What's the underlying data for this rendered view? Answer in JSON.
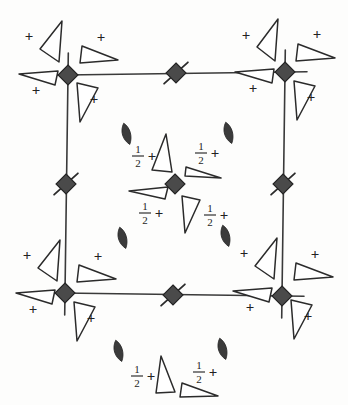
{
  "diagram": {
    "kind": "space-group-symmetry-diagram",
    "title": "",
    "background_color": "#fdfdfc",
    "ink_color": "#2b2b2b",
    "symbol_fill_color": "#4a4a4a",
    "cell": {
      "name": "unit-cell-outline",
      "corners": [
        {
          "x": 68,
          "y": 75
        },
        {
          "x": 285,
          "y": 72
        },
        {
          "x": 282,
          "y": 296
        },
        {
          "x": 65,
          "y": 293
        }
      ]
    },
    "symmetry_elements": {
      "inversion_tetrad": {
        "glyph": "filled-diamond",
        "label": "4-bar",
        "positions": [
          {
            "name": "corner-top-left",
            "x": 68,
            "y": 75
          },
          {
            "name": "corner-top-right",
            "x": 285,
            "y": 72
          },
          {
            "name": "corner-bottom-right",
            "x": 282,
            "y": 296
          },
          {
            "name": "corner-bottom-left",
            "x": 65,
            "y": 293
          },
          {
            "name": "cell-center",
            "x": 175,
            "y": 184
          }
        ],
        "size": 10
      },
      "tetrad_with_tails": {
        "glyph": "filled-diamond-with-diagonal-tails",
        "label": "4-bar with 2-fold tails",
        "positions": [
          {
            "name": "edge-mid-top",
            "x": 176,
            "y": 73,
            "tail_angle": -42
          },
          {
            "name": "edge-mid-bottom",
            "x": 173,
            "y": 295,
            "tail_angle": -42
          },
          {
            "name": "edge-mid-left",
            "x": 66,
            "y": 184,
            "tail_angle": -42
          },
          {
            "name": "edge-mid-right",
            "x": 283,
            "y": 184,
            "tail_angle": -42
          }
        ],
        "size": 10,
        "tail_length": 16
      },
      "diad_lens": {
        "glyph": "pointed-lens",
        "label": "2-fold axis",
        "positions": [
          {
            "name": "lens-inner-top-left",
            "x": 126,
            "y": 134
          },
          {
            "name": "lens-inner-top-right",
            "x": 228,
            "y": 133
          },
          {
            "name": "lens-inner-bottom-left",
            "x": 122,
            "y": 238
          },
          {
            "name": "lens-inner-bottom-right",
            "x": 225,
            "y": 236
          },
          {
            "name": "lens-outer-bottom-left",
            "x": 118,
            "y": 351
          },
          {
            "name": "lens-outer-bottom-right",
            "x": 222,
            "y": 349
          }
        ]
      }
    },
    "motifs": {
      "plus_label": "+",
      "half_plus_label": "½+",
      "fraction_numerator": "1",
      "fraction_denominator": "2",
      "groups": [
        {
          "name": "motif-group-corner-top-left",
          "height_label": "+",
          "triangles": [
            {
              "name": "triangle-tl-a",
              "points": "40,49 62,21 59,62",
              "plus": {
                "x": 29,
                "y": 38
              }
            },
            {
              "name": "triangle-tl-b",
              "points": "82,46 118,60 80,63",
              "plus": {
                "x": 101,
                "y": 39
              }
            },
            {
              "name": "triangle-tl-c",
              "points": "55,85 19,74 58,71",
              "plus": {
                "x": 36,
                "y": 92
              }
            },
            {
              "name": "triangle-tl-d",
              "points": "77,83 80,122 98,88",
              "plus": {
                "x": 94,
                "y": 101
              }
            }
          ]
        },
        {
          "name": "motif-group-corner-top-right",
          "height_label": "+",
          "triangles": [
            {
              "name": "triangle-tr-a",
              "points": "257,47 278,19 275,61",
              "plus": {
                "x": 246,
                "y": 37
              }
            },
            {
              "name": "triangle-tr-b",
              "points": "298,44 335,58 296,61",
              "plus": {
                "x": 317,
                "y": 36
              }
            },
            {
              "name": "triangle-tr-c",
              "points": "272,83 235,72 274,69",
              "plus": {
                "x": 253,
                "y": 90
              }
            },
            {
              "name": "triangle-tr-d",
              "points": "294,81 297,120 315,86",
              "plus": {
                "x": 311,
                "y": 99
              }
            }
          ]
        },
        {
          "name": "motif-group-corner-bottom-left",
          "height_label": "+",
          "triangles": [
            {
              "name": "triangle-bl-a",
              "points": "38,268 60,240 57,281",
              "plus": {
                "x": 27,
                "y": 257
              }
            },
            {
              "name": "triangle-bl-b",
              "points": "79,265 116,279 77,282",
              "plus": {
                "x": 98,
                "y": 258
              }
            },
            {
              "name": "triangle-bl-c",
              "points": "52,304 16,293 55,290",
              "plus": {
                "x": 33,
                "y": 311
              }
            },
            {
              "name": "triangle-bl-d",
              "points": "74,302 77,341 95,307",
              "plus": {
                "x": 91,
                "y": 320
              }
            }
          ]
        },
        {
          "name": "motif-group-corner-bottom-right",
          "height_label": "+",
          "triangles": [
            {
              "name": "triangle-br-a",
              "points": "255,266 277,238 274,279",
              "plus": {
                "x": 244,
                "y": 255
              }
            },
            {
              "name": "triangle-br-b",
              "points": "296,263 333,277 294,280",
              "plus": {
                "x": 315,
                "y": 256
              }
            },
            {
              "name": "triangle-br-c",
              "points": "269,302 233,291 272,288",
              "plus": {
                "x": 250,
                "y": 309
              }
            },
            {
              "name": "triangle-br-d",
              "points": "291,300 294,339 312,305",
              "plus": {
                "x": 308,
                "y": 318
              }
            }
          ]
        },
        {
          "name": "motif-group-cell-center",
          "height_label": "½+",
          "triangles": [
            {
              "name": "triangle-c-a",
              "points": "152,170 166,134 172,172",
              "half": {
                "x": 138,
                "y": 156
              }
            },
            {
              "name": "triangle-c-b",
              "points": "186,167 221,178 185,176",
              "half": {
                "x": 201,
                "y": 153
              }
            },
            {
              "name": "triangle-c-c",
              "points": "165,199 129,191 168,187",
              "half": {
                "x": 145,
                "y": 213
              }
            },
            {
              "name": "triangle-c-d",
              "points": "182,196 185,233 200,200",
              "half": {
                "x": 210,
                "y": 215
              }
            }
          ]
        },
        {
          "name": "motif-group-below-cell",
          "height_label": "½+",
          "triangles": [
            {
              "name": "triangle-bb-a",
              "points": "156,393 161,356 175,392",
              "half": {
                "x": 137,
                "y": 376
              }
            },
            {
              "name": "triangle-bb-b",
              "points": "182,383 218,396 180,397",
              "half": {
                "x": 199,
                "y": 372
              }
            }
          ]
        }
      ]
    }
  },
  "chart_data": {
    "type": "diagram",
    "categories": [
      "4-bar inversion tetrad",
      "4-bar tetrad with 2-fold tails",
      "2-fold lens axis",
      "general position motif +",
      "general position motif 1/2+"
    ],
    "values": [
      5,
      4,
      6,
      16,
      6
    ],
    "xlabel": "symmetry element",
    "ylabel": "count",
    "legend_position": "none",
    "grid": false
  }
}
